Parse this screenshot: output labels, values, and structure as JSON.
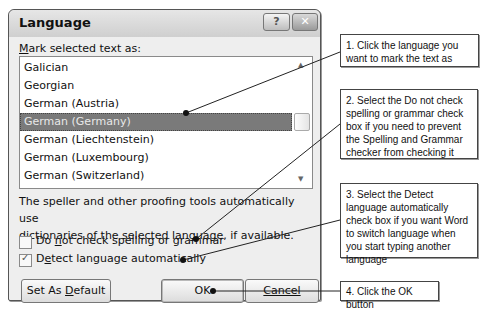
{
  "dialog": {
    "title": "Language",
    "help_button": "?",
    "close_button": "✕",
    "list_label_prefix": "M",
    "list_label_rest": "ark selected text as:",
    "languages": [
      "Galician",
      "Georgian",
      "German (Austria)",
      "German (Germany)",
      "German (Liechtenstein)",
      "German (Luxembourg)",
      "German (Switzerland)",
      "Greek"
    ],
    "selected_language": "German (Germany)",
    "description_line1": "The speller and other proofing tools automatically use",
    "description_line2": "dictionaries of the selected language, if available.",
    "checkbox_no_check": {
      "pre": "Do ",
      "accel": "n",
      "post": "ot check spelling or grammar",
      "checked": false
    },
    "checkbox_detect": {
      "pre": "D",
      "accel": "e",
      "post": "tect language automatically",
      "checked": true,
      "tick": "✓"
    },
    "buttons": {
      "set_default_pre": "Set As ",
      "set_default_accel": "D",
      "set_default_post": "efault",
      "ok": "OK",
      "cancel": "Cancel"
    }
  },
  "callouts": [
    "1. Click the language you want to mark the text as",
    "2. Select the Do not check spelling or grammar check box if you need to prevent the Spelling and Grammar checker from checking it",
    "3. Select the Detect language automatically check box if you want Word to switch language when you start typing another language",
    "4. Click the OK button"
  ],
  "colors": {
    "selection": "#7a7a7a",
    "dialog_bg": "#eeeeee",
    "callout_border": "#444444"
  }
}
